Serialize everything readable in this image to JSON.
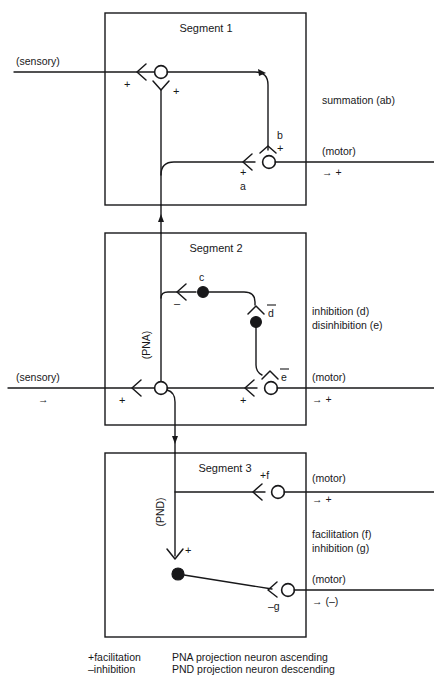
{
  "figure": {
    "background_color": "#ffffff",
    "ink_color": "#18181a"
  },
  "segments": [
    {
      "id": "segment-1",
      "title": "Segment 1",
      "input_label": "(sensory)",
      "output_label": "(motor)",
      "output_sign": "→  +",
      "right_annotation": "summation (ab)",
      "synapse_labels": [
        "+",
        "+",
        "b",
        "+",
        "+",
        "a"
      ]
    },
    {
      "id": "segment-2",
      "title": "Segment 2",
      "input_label": "(sensory)",
      "input_arrow": "→",
      "output_label": "(motor)",
      "output_sign": "→  +",
      "right_annotation_1": "inhibition (d)",
      "right_annotation_2": "disinhibition (e)",
      "tract_label": "(PNA)",
      "neuron_c": "c",
      "neuron_d": "d",
      "neuron_e": "e",
      "sign_minus_c": "–",
      "sign_plus_in": "+",
      "sign_plus_e": "+"
    },
    {
      "id": "segment-3",
      "title": "Segment 3",
      "tract_label": "(PND)",
      "motor_1_label": "(motor)",
      "motor_1_sign": "→  +",
      "motor_2_label": "(motor)",
      "motor_2_sign": "→  (–)",
      "right_annotation_1": "facilitation (f)",
      "right_annotation_2": "inhibition (g)",
      "neuron_f": "+f",
      "neuron_g": "–g",
      "sign_plus_interneuron": "+"
    }
  ],
  "legend": {
    "col1": [
      "+facilitation",
      "–inhibition"
    ],
    "col2": [
      "PNA projection neuron ascending",
      "PND projection neuron descending"
    ]
  }
}
